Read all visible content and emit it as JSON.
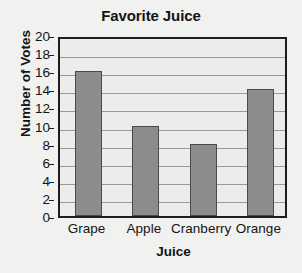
{
  "chart_data": {
    "type": "bar",
    "title": "Favorite Juice",
    "xlabel": "Juice",
    "ylabel": "Number of Votes",
    "categories": [
      "Grape",
      "Apple",
      "Cranberry",
      "Orange"
    ],
    "values": [
      16,
      10,
      8,
      14
    ],
    "ylim": [
      0,
      20
    ],
    "ytick_step": 2,
    "yticks": [
      20,
      18,
      16,
      14,
      12,
      10,
      8,
      6,
      4,
      2,
      0
    ],
    "grid": "horizontal",
    "legend": "none",
    "colors": {
      "bar_fill": "#8c8c8c",
      "bar_edge": "#4a4a4a",
      "plot_background": "#ececeb",
      "figure_background": "#f1f1f0",
      "axis": "#1d1d1d",
      "gridline": "#9a9a9a",
      "text": "#141414"
    }
  }
}
